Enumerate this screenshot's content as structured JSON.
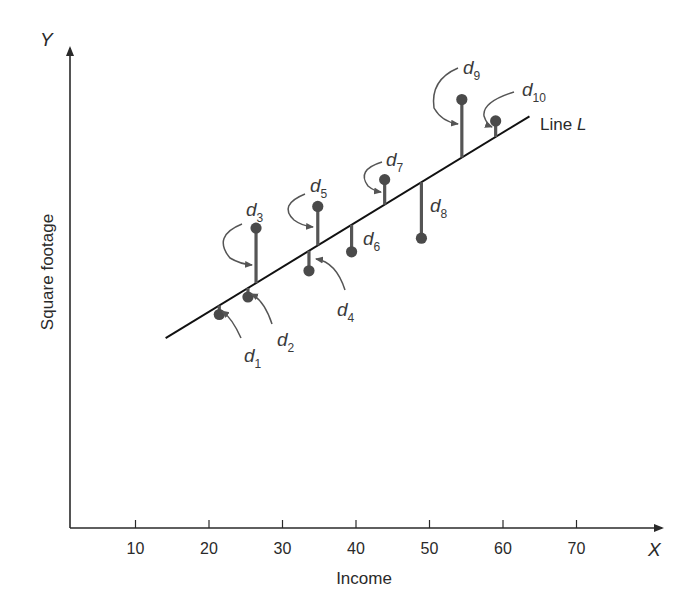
{
  "chart_data": {
    "type": "scatter",
    "title": "",
    "xlabel": "Income",
    "ylabel": "Square footage",
    "x_axis_letter": "X",
    "y_axis_letter": "Y",
    "xlim": [
      0,
      80
    ],
    "x_ticks": [
      10,
      20,
      30,
      40,
      50,
      60,
      70
    ],
    "y_ticks": [],
    "grid": false,
    "legend": null,
    "regression_line": {
      "label": "Line",
      "label_italic": "L",
      "x_start": 14.1,
      "x_end": 63.6
    },
    "points": [
      {
        "label": "d",
        "sub": "1",
        "x": 21.4,
        "y_rel": -9
      },
      {
        "label": "d",
        "sub": "2",
        "x": 25.3,
        "y_rel": -9
      },
      {
        "label": "d",
        "sub": "3",
        "x": 26.4,
        "y_rel": 55
      },
      {
        "label": "d",
        "sub": "4",
        "x": 33.6,
        "y_rel": -20
      },
      {
        "label": "d",
        "sub": "5",
        "x": 34.8,
        "y_rel": 39
      },
      {
        "label": "d",
        "sub": "6",
        "x": 39.4,
        "y_rel": -27
      },
      {
        "label": "d",
        "sub": "7",
        "x": 43.9,
        "y_rel": 25
      },
      {
        "label": "d",
        "sub": "8",
        "x": 48.9,
        "y_rel": -56
      },
      {
        "label": "d",
        "sub": "9",
        "x": 54.4,
        "y_rel": 58
      },
      {
        "label": "d",
        "sub": "10",
        "x": 59.0,
        "y_rel": 16
      }
    ],
    "annotations": [
      "d1",
      "d2",
      "d3",
      "d4",
      "d5",
      "d6",
      "d7",
      "d8",
      "d9",
      "d10",
      "Line L"
    ]
  },
  "colors": {
    "axis": "#2a2a2a",
    "line": "#111111",
    "residual": "#555555",
    "point": "#4a4a4a",
    "background": "#ffffff"
  }
}
